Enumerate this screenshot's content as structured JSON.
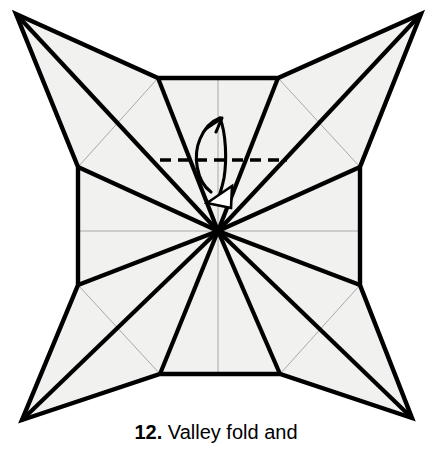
{
  "figure": {
    "kind": "origami-folding-diagram",
    "background_color": "#ffffff",
    "paper_fill_color": "#f1f1ef",
    "paper_outline_color": "#000000",
    "major_crease_color": "#000000",
    "minor_crease_color": "#a8a8a8",
    "fold_line_color": "#000000",
    "arrow_color": "#000000",
    "canvas": {
      "width": 432,
      "height": 452
    }
  },
  "caption": {
    "step_number": "12.",
    "instruction": " Valley fold and"
  },
  "annotations": {
    "fold_line_label": "valley-fold-dashed-line",
    "fold_line_style": "dashed",
    "arrow_label": "fold-and-unfold-arrow",
    "arrow_head_style": "hollow-triangle"
  },
  "geometry": {
    "center_point": {
      "x": 218,
      "y": 231
    },
    "star_points": [
      {
        "name": "top-left-point",
        "x": 16,
        "y": 14
      },
      {
        "name": "top-right-point",
        "x": 421,
        "y": 14
      },
      {
        "name": "bottom-right-point",
        "x": 412,
        "y": 418
      },
      {
        "name": "bottom-left-point",
        "x": 22,
        "y": 420
      }
    ],
    "octagon_vertices": [
      {
        "x": 158,
        "y": 78
      },
      {
        "x": 278,
        "y": 78
      },
      {
        "x": 360,
        "y": 167
      },
      {
        "x": 360,
        "y": 285
      },
      {
        "x": 280,
        "y": 374
      },
      {
        "x": 160,
        "y": 374
      },
      {
        "x": 78,
        "y": 285
      },
      {
        "x": 78,
        "y": 167
      }
    ],
    "fold_line": {
      "x1": 160,
      "y1": 160,
      "x2": 286,
      "y2": 160
    }
  }
}
